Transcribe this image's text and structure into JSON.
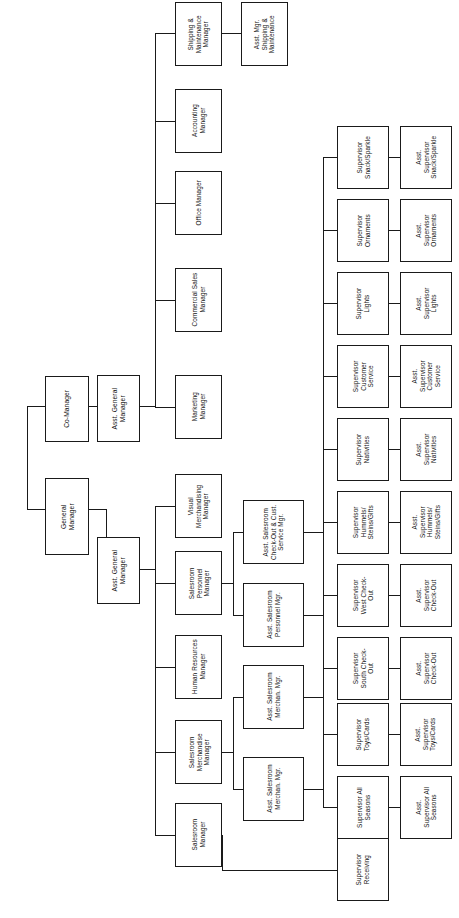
{
  "document": {
    "kind": "organization-chart",
    "orientation": "rotated-90-ccw",
    "title": "Retail Store Organization Chart"
  },
  "colors": {
    "box_border": "#1a1a1a",
    "box_fill": "#ffffff",
    "connector": "#1a1a1a",
    "text": "#111111",
    "background": "#ffffff"
  },
  "chart_data": {
    "type": "diagram",
    "subtype": "org-chart",
    "levels": 5,
    "node_count": 41
  },
  "nodes": {
    "general_manager": "General\nManager",
    "co_manager": "Co-Manager",
    "agm_upper": "Asst. General\nManager",
    "agm_lower": "Asst. General\nManager",
    "shipping_maintenance_manager": "Shipping &\nMaintenance\nManager",
    "asst_mgr_shipping_maintenance": "Asst. Mgr.\nShipping &\nMaintenance",
    "accounting_manager": "Accounting\nManager",
    "office_manager": "Office Manager",
    "commercial_sales_manager": "Commercial Sales\nManager",
    "marketing_manager": "Marketing\nManager",
    "visual_merchandising_manager": "Visual\nMerchandising\nManager",
    "salesroom_personnel_manager": "Salesroom\nPersonnel\nManager",
    "human_resources_manager": "Human Resources\nManager",
    "salesroom_merchandise_manager": "Salesroom\nMerchandise\nManager",
    "salesroom_manager": "Salesroom\nManager",
    "asst_salesroom_checkout_cust_service_mgr": "Asst. Salesroom\nCheck-Out & Cust.\nService Mgr.",
    "asst_salesroom_personnel_mgr": "Asst. Salesroom\nPersonnel Mgr.",
    "asst_salesroom_merchan_mgr_1": "Asst. Salesroom\nMerchan. Mgr.",
    "asst_salesroom_merchan_mgr_2": "Asst. Salesroom\nMerchan. Mgr."
  },
  "supervisors": [
    {
      "id": "snack-sparkle",
      "supervisor": "Supervisor\nSnack/Sparkle",
      "assistant": "Asst.\nSupervisor\nSnack/Sparkle"
    },
    {
      "id": "ornaments",
      "supervisor": "Supervisor\nOrnaments",
      "assistant": "Asst.\nSupervisor\nOrnaments"
    },
    {
      "id": "lights",
      "supervisor": "Supervisor\nLights",
      "assistant": "Asst.\nSupervisor\nLights"
    },
    {
      "id": "customer-service",
      "supervisor": "Supervisor\nCustomer\nService",
      "assistant": "Asst.\nSupervisor\nCustomer\nService"
    },
    {
      "id": "nativities",
      "supervisor": "Supervisor\nNativities",
      "assistant": "Asst.\nSupervisor\nNativities"
    },
    {
      "id": "hummels-gifts",
      "supervisor": "Supervisor\nHummels/\nSteins/Gifts",
      "assistant": "Asst.\nSupervisor\nHummels/\nSteins/Gifts"
    },
    {
      "id": "west-check-out",
      "supervisor": "Supervisor\nWest Check-\nOut",
      "assistant": "Asst.\nSupervisor\nCheck-Out"
    },
    {
      "id": "south-check-out",
      "supervisor": "Supervisor\nSouth Check-\nOut",
      "assistant": "Asst.\nSupervisor\nCheck-Out"
    },
    {
      "id": "toys-cards",
      "supervisor": "Supervisor\nToys/Cards",
      "assistant": "Asst.\nSupervisor\nToys/Cards"
    },
    {
      "id": "all-seasons",
      "supervisor": "Supervisor All\nSeasons",
      "assistant": "Asst.\nSupervisor All\nSeasons"
    },
    {
      "id": "receiving",
      "supervisor": "Supervisor\nReceiving",
      "assistant": ""
    }
  ]
}
